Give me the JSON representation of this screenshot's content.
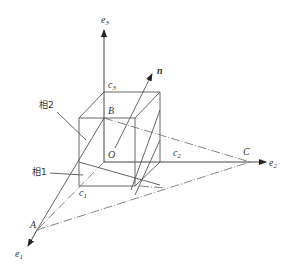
{
  "diagram": {
    "title": "",
    "axes": {
      "e1": "e",
      "e1_sub": "1",
      "e2": "e",
      "e2_sub": "2",
      "e3": "e",
      "e3_sub": "3"
    },
    "points": {
      "A": "A",
      "B": "B",
      "C": "C",
      "O": "O",
      "c1": "c",
      "c1_sub": "1",
      "c2": "c",
      "c2_sub": "2",
      "c3": "c",
      "c3_sub": "3"
    },
    "normal_vector": "n",
    "phase_labels": {
      "phase2": "相2",
      "phase1": "相1"
    },
    "colors": {
      "line": "#555555",
      "text": "#333333",
      "background": "#ffffff"
    }
  }
}
